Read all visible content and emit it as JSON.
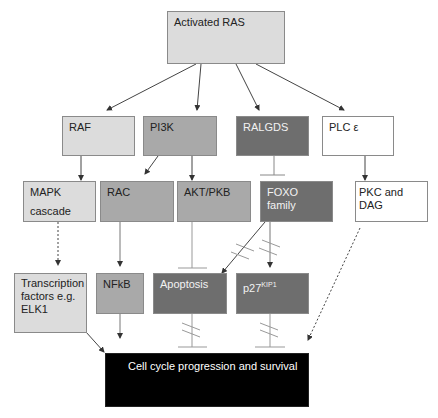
{
  "diagram": {
    "nodes": {
      "ras": {
        "label": "Activated RAS"
      },
      "raf": {
        "label": "RAF"
      },
      "pi3k": {
        "label": "PI3K"
      },
      "ralgds": {
        "label": "RALGDS"
      },
      "plc": {
        "label": "PLC ε"
      },
      "mapk": {
        "label": "MAPK",
        "label2": "cascade"
      },
      "rac": {
        "label": "RAC"
      },
      "akt": {
        "label": "AKT/PKB"
      },
      "foxo": {
        "label": "FOXO family"
      },
      "pkc": {
        "label": "PKC and DAG"
      },
      "tf": {
        "label": "Transcription factors e.g. ELK1"
      },
      "nfkb": {
        "label": "NFkB"
      },
      "apoptosis": {
        "label": "Apoptosis"
      },
      "p27": {
        "label": "p27",
        "sup": "KIP1"
      },
      "cell": {
        "label": "Cell cycle progression and survival"
      }
    },
    "edges": [
      {
        "from": "ras",
        "to": "raf",
        "type": "activate"
      },
      {
        "from": "ras",
        "to": "pi3k",
        "type": "activate"
      },
      {
        "from": "ras",
        "to": "ralgds",
        "type": "activate"
      },
      {
        "from": "ras",
        "to": "plc",
        "type": "activate"
      },
      {
        "from": "raf",
        "to": "mapk",
        "type": "activate"
      },
      {
        "from": "pi3k",
        "to": "rac",
        "type": "activate"
      },
      {
        "from": "pi3k",
        "to": "akt",
        "type": "activate"
      },
      {
        "from": "ralgds",
        "to": "foxo",
        "type": "inhibit"
      },
      {
        "from": "plc",
        "to": "pkc",
        "type": "activate"
      },
      {
        "from": "mapk",
        "to": "tf",
        "type": "dashed-activate"
      },
      {
        "from": "rac",
        "to": "nfkb",
        "type": "activate"
      },
      {
        "from": "akt",
        "to": "apoptosis",
        "type": "inhibit"
      },
      {
        "from": "foxo",
        "to": "apoptosis",
        "type": "activate-broken"
      },
      {
        "from": "foxo",
        "to": "p27",
        "type": "activate-broken"
      },
      {
        "from": "pkc",
        "to": "cell",
        "type": "dashed-activate"
      },
      {
        "from": "tf",
        "to": "cell",
        "type": "activate"
      },
      {
        "from": "nfkb",
        "to": "cell",
        "type": "activate"
      },
      {
        "from": "apoptosis",
        "to": "cell",
        "type": "inhibit-broken"
      },
      {
        "from": "p27",
        "to": "cell",
        "type": "inhibit-broken"
      }
    ]
  }
}
